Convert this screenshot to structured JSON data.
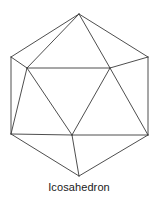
{
  "figure": {
    "caption": "Icosahedron",
    "shape_name": "icosahedron",
    "diagram_type": "wireframe-polyhedron",
    "stroke_color": "#3a3a3a",
    "background_color": "#ffffff",
    "stroke_width": 0.9,
    "view": {
      "width": 158,
      "height": 198
    },
    "vertices": [
      {
        "id": "top-apex",
        "x": 79,
        "y": 14
      },
      {
        "id": "upper-left-out",
        "x": 11,
        "y": 57
      },
      {
        "id": "upper-right-out",
        "x": 148,
        "y": 57
      },
      {
        "id": "upper-left-in",
        "x": 27,
        "y": 68
      },
      {
        "id": "upper-right-in",
        "x": 110,
        "y": 68
      },
      {
        "id": "lower-left-out",
        "x": 11,
        "y": 134
      },
      {
        "id": "lower-right-out",
        "x": 148,
        "y": 135
      },
      {
        "id": "lower-mid-in",
        "x": 72,
        "y": 135
      },
      {
        "id": "bottom-apex",
        "x": 79,
        "y": 176
      }
    ],
    "edges": [
      {
        "from": "top-apex",
        "to": "upper-left-out"
      },
      {
        "from": "top-apex",
        "to": "upper-left-in"
      },
      {
        "from": "top-apex",
        "to": "upper-right-in"
      },
      {
        "from": "top-apex",
        "to": "upper-right-out"
      },
      {
        "from": "upper-left-out",
        "to": "upper-left-in"
      },
      {
        "from": "upper-right-out",
        "to": "upper-right-in"
      },
      {
        "from": "upper-left-in",
        "to": "upper-right-in"
      },
      {
        "from": "upper-left-out",
        "to": "lower-left-out"
      },
      {
        "from": "upper-right-out",
        "to": "lower-right-out"
      },
      {
        "from": "upper-left-in",
        "to": "lower-left-out"
      },
      {
        "from": "upper-left-in",
        "to": "lower-mid-in"
      },
      {
        "from": "upper-right-in",
        "to": "lower-mid-in"
      },
      {
        "from": "upper-right-in",
        "to": "lower-right-out"
      },
      {
        "from": "lower-left-out",
        "to": "lower-mid-in"
      },
      {
        "from": "lower-mid-in",
        "to": "lower-right-out"
      },
      {
        "from": "lower-left-out",
        "to": "bottom-apex"
      },
      {
        "from": "lower-mid-in",
        "to": "bottom-apex"
      },
      {
        "from": "lower-right-out",
        "to": "bottom-apex"
      }
    ]
  }
}
